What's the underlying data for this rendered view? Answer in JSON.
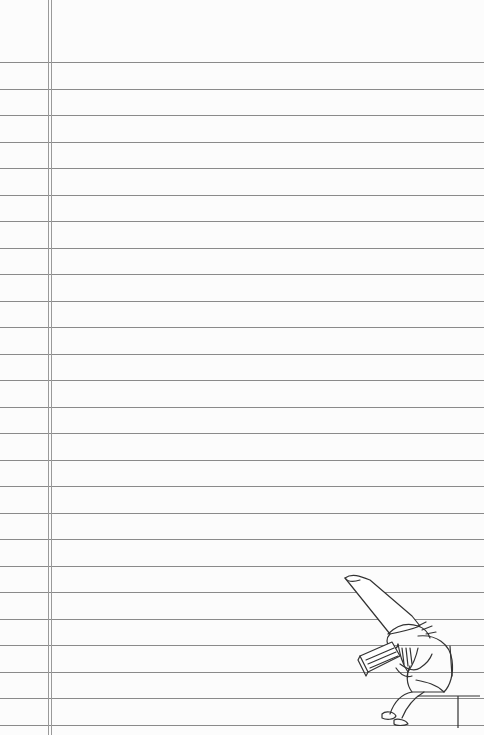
{
  "page": {
    "type": "lined-notebook-paper",
    "background_color": "#fcfcfc",
    "rule_color": "#8a8a8a",
    "margin_color": "#9a9a9a",
    "first_rule_y": 62,
    "rule_spacing": 26.5,
    "rule_count": 26,
    "margin_lines_x": [
      48,
      51
    ]
  },
  "illustration": {
    "subject": "gnome-reading-book",
    "description": "Line drawing of a gnome with a tall pointed hat and beard, seated on a step, reading a book"
  }
}
